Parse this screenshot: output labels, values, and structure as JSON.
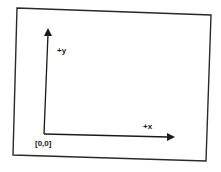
{
  "diagram": {
    "type": "coordinate-axes",
    "frame": {
      "stroke": "#2a2a2a"
    },
    "axes": {
      "color": "#1a1a1a",
      "y_label": "+y",
      "x_label": "+x",
      "origin_label": "[0,0]"
    }
  }
}
